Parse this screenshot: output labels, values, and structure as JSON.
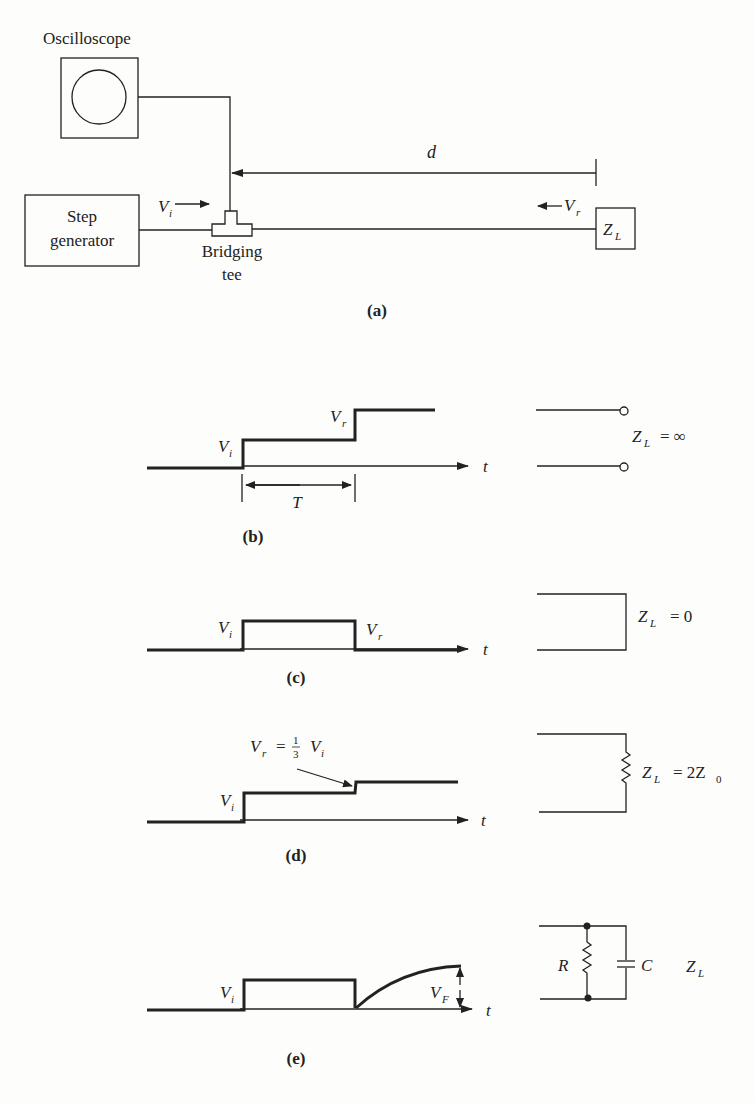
{
  "figure": {
    "panel_a": {
      "caption": "(a)",
      "oscilloscope_label": "Oscilloscope",
      "step_generator_label_line1": "Step",
      "step_generator_label_line2": "generator",
      "tee_label_line1": "Bridging",
      "tee_label_line2": "tee",
      "incident_label": "V",
      "incident_sub": "i",
      "reflected_label": "V",
      "reflected_sub": "r",
      "distance_label": "d",
      "load_label": "Z",
      "load_sub": "L"
    },
    "panel_b": {
      "caption": "(b)",
      "vi_label": "V",
      "vi_sub": "i",
      "vr_label": "V",
      "vr_sub": "r",
      "time_label": "t",
      "period_label": "T",
      "load_eq": "Z",
      "load_sub": "L",
      "load_value": "= ∞"
    },
    "panel_c": {
      "caption": "(c)",
      "vi_label": "V",
      "vi_sub": "i",
      "vr_label": "V",
      "vr_sub": "r",
      "time_label": "t",
      "load_eq": "Z",
      "load_sub": "L",
      "load_value": "= 0"
    },
    "panel_d": {
      "caption": "(d)",
      "vi_label": "V",
      "vi_sub": "i",
      "annotation_lhs": "V",
      "annotation_lhs_sub": "r",
      "annotation_eq": "=",
      "annotation_num": "1",
      "annotation_den": "3",
      "annotation_rhs": "V",
      "annotation_rhs_sub": "i",
      "time_label": "t",
      "load_eq": "Z",
      "load_sub": "L",
      "load_value": "= 2Z",
      "load_value_sub": "0"
    },
    "panel_e": {
      "caption": "(e)",
      "vi_label": "V",
      "vi_sub": "i",
      "vf_label": "V",
      "vf_sub": "F",
      "time_label": "t",
      "resistor_label": "R",
      "capacitor_label": "C",
      "load_eq": "Z",
      "load_sub": "L"
    }
  }
}
